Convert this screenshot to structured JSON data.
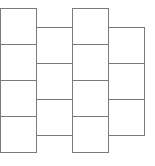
{
  "diagram": {
    "type": "staggered-grid",
    "line_color": "#7a7a7a",
    "background": "#ffffff",
    "cell_width": 37,
    "cell_height": 37,
    "columns": [
      {
        "index": 0,
        "x": 0,
        "y": 8,
        "cells": 4
      },
      {
        "index": 1,
        "x": 36,
        "y": 27,
        "cells": 3
      },
      {
        "index": 2,
        "x": 72,
        "y": 8,
        "cells": 4
      },
      {
        "index": 3,
        "x": 108,
        "y": 27,
        "cells": 3
      }
    ]
  }
}
